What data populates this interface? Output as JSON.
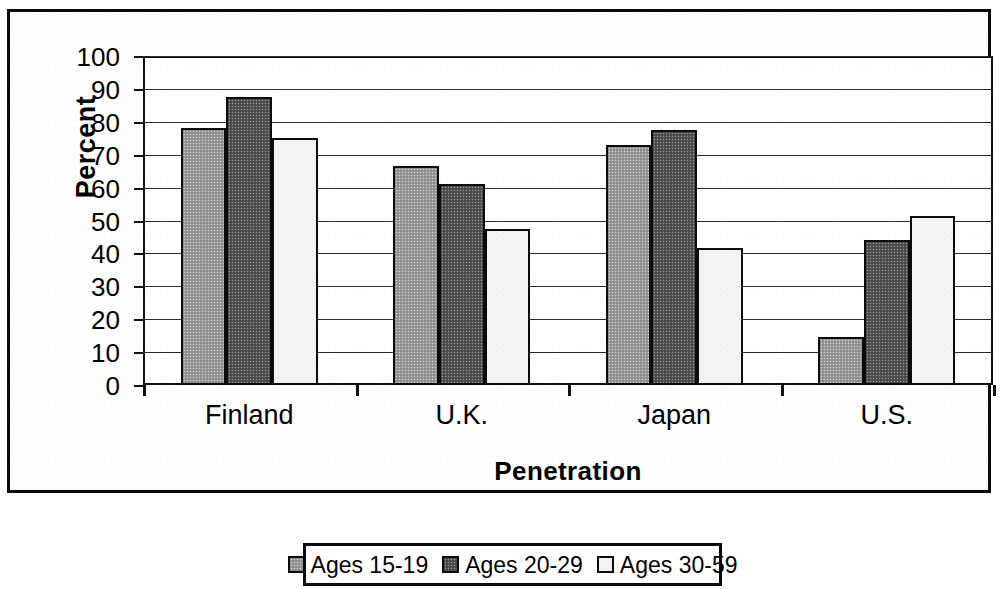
{
  "chart_data": {
    "type": "bar",
    "title": "",
    "xlabel": "Penetration",
    "ylabel": "Percent",
    "categories": [
      "Finland",
      "U.K.",
      "Japan",
      "U.S."
    ],
    "series": [
      {
        "name": "Ages 15-19",
        "values": [
          78,
          66.5,
          73,
          14.5
        ],
        "color": "#9b9b9b"
      },
      {
        "name": "Ages 20-29",
        "values": [
          87.5,
          61,
          77.5,
          44
        ],
        "color": "#555555"
      },
      {
        "name": "Ages 30-59",
        "values": [
          75,
          47.5,
          41.5,
          51.5
        ],
        "color": "#f3f3f3"
      }
    ],
    "ylim": [
      0,
      100
    ],
    "ytick_step": 10,
    "yticks": [
      "100",
      "90",
      "80",
      "70",
      "60",
      "50",
      "40",
      "30",
      "20",
      "10",
      "0"
    ],
    "grid": true,
    "legend_position": "bottom",
    "legend_entries": [
      "Ages 15-19",
      "Ages 20-29",
      "Ages 30-59"
    ]
  },
  "legend": {
    "items": [
      {
        "label": "Ages 15-19",
        "swatch": "legend-swatch-ages-15-19"
      },
      {
        "label": "Ages 20-29",
        "swatch": "legend-swatch-ages-20-29"
      },
      {
        "label": "Ages 30-59",
        "swatch": "legend-swatch-ages-30-59"
      }
    ]
  }
}
